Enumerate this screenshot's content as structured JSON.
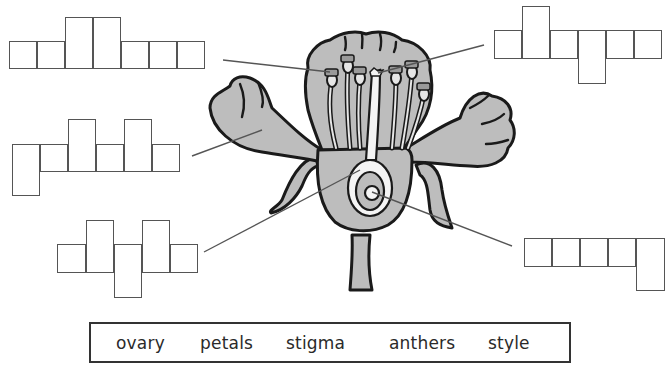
{
  "diagram": {
    "fill_color": "#bdbdbd",
    "outline_color": "#1a1a1a",
    "line_color": "#555555"
  },
  "puzzles": [
    {
      "id": "top-left",
      "points_to": "anthers",
      "letters": 7,
      "cells": [
        [
          9,
          41,
          28,
          28
        ],
        [
          37,
          41,
          28,
          28
        ],
        [
          65,
          17,
          28,
          52
        ],
        [
          93,
          17,
          28,
          52
        ],
        [
          121,
          41,
          28,
          28
        ],
        [
          149,
          41,
          28,
          28
        ],
        [
          177,
          41,
          28,
          28
        ]
      ]
    },
    {
      "id": "mid-left",
      "points_to": "petals",
      "letters": 6,
      "cells": [
        [
          12,
          144,
          28,
          52
        ],
        [
          40,
          144,
          28,
          28
        ],
        [
          68,
          119,
          28,
          53
        ],
        [
          96,
          144,
          28,
          28
        ],
        [
          124,
          119,
          28,
          53
        ],
        [
          152,
          144,
          28,
          28
        ]
      ]
    },
    {
      "id": "bottom-left",
      "points_to": "ovary",
      "letters": 5,
      "cells": [
        [
          57,
          244,
          29,
          29
        ],
        [
          86,
          220,
          28,
          53
        ],
        [
          114,
          244,
          28,
          54
        ],
        [
          142,
          220,
          28,
          53
        ],
        [
          170,
          244,
          28,
          29
        ]
      ]
    },
    {
      "id": "top-right",
      "points_to": "stigma",
      "letters": 6,
      "cells": [
        [
          494,
          30,
          28,
          29
        ],
        [
          522,
          6,
          28,
          53
        ],
        [
          550,
          30,
          28,
          29
        ],
        [
          578,
          30,
          28,
          54
        ],
        [
          606,
          30,
          28,
          29
        ],
        [
          634,
          30,
          28,
          29
        ]
      ]
    },
    {
      "id": "bottom-right",
      "points_to": "style",
      "letters": 5,
      "cells": [
        [
          524,
          238,
          28,
          29
        ],
        [
          552,
          238,
          28,
          29
        ],
        [
          580,
          238,
          28,
          29
        ],
        [
          608,
          238,
          28,
          29
        ],
        [
          636,
          238,
          29,
          53
        ]
      ]
    }
  ],
  "word_bank": {
    "words": [
      "ovary",
      "petals",
      "stigma",
      "anthers",
      "style"
    ],
    "positions": [
      114,
      198,
      284,
      387,
      486
    ]
  }
}
